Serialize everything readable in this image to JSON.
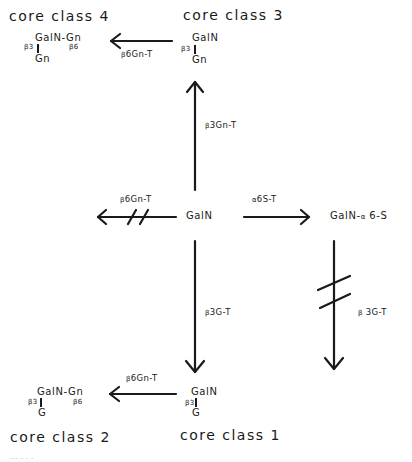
{
  "diagram": {
    "nodes": {
      "center": {
        "label": "GalN"
      },
      "sulfated": {
        "label": "GalN-",
        "alpha": "α",
        "suffix": " 6-S"
      },
      "core3": {
        "title": "core  class 3",
        "top": "GalN",
        "link": "β3",
        "bottom": "Gn"
      },
      "core4": {
        "title": "core  class 4",
        "top": "GalN-Gn",
        "link_left": "β3",
        "link_right": "β6",
        "bottom": "Gn"
      },
      "core1": {
        "title": "core  class 1",
        "top": "GalN",
        "link": "β3",
        "bottom": "G"
      },
      "core2": {
        "title": "core  class 2",
        "top": "GalN-Gn",
        "link_left": "β3",
        "link_right": "β6",
        "bottom": "G"
      }
    },
    "edges": [
      {
        "from": "center",
        "to": "core3",
        "label_prefix": "β",
        "label": "3Gn-T",
        "blocked": false
      },
      {
        "from": "core3",
        "to": "core4",
        "label_prefix": "β",
        "label": "6Gn-T",
        "blocked": false
      },
      {
        "from": "center",
        "to": "left",
        "label_prefix": "β",
        "label": "6Gn-T",
        "blocked": true
      },
      {
        "from": "center",
        "to": "sulfated",
        "label_prefix": "α",
        "label": "6S-T",
        "blocked": false
      },
      {
        "from": "sulfated",
        "to": "down",
        "label_prefix": "β",
        "label": " 3G-T",
        "blocked": true
      },
      {
        "from": "center",
        "to": "core1",
        "label_prefix": "β",
        "label": "3G-T",
        "blocked": false
      },
      {
        "from": "core1",
        "to": "core2",
        "label_prefix": "β",
        "label": "6Gn-T",
        "blocked": false
      }
    ],
    "caption": "…                         . . ."
  }
}
